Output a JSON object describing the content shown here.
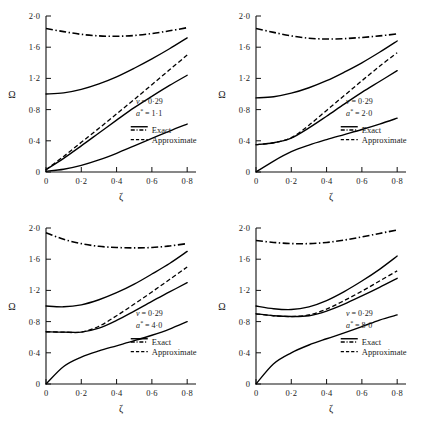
{
  "figure": {
    "type": "multi-panel-line-chart",
    "panel_count": 4,
    "layout": "2x2"
  },
  "axes": {
    "xlabel": "ζ",
    "ylabel": "Ω",
    "xticks": [
      "0",
      "0·2",
      "0·4",
      "0·6",
      "0·8"
    ],
    "xtick_values": [
      0,
      0.2,
      0.4,
      0.6,
      0.8
    ],
    "yticks": [
      "0",
      "0·4",
      "0·8",
      "1·2",
      "1·6",
      "2·0"
    ],
    "ytick_values": [
      0,
      0.4,
      0.8,
      1.2,
      1.6,
      2.0
    ],
    "xlim": [
      0,
      0.85
    ],
    "ylim": [
      0,
      2.0
    ],
    "grid": false
  },
  "legend": {
    "exact_label": "Exact",
    "approximate_label": "Approximate",
    "position": "inside-lower-right"
  },
  "chart_data": [
    {
      "type": "line",
      "panel": 1,
      "position": "top-left",
      "title": "",
      "xlabel": "ζ",
      "ylabel": "Ω",
      "xlim": [
        0,
        0.85
      ],
      "ylim": [
        0,
        2.0
      ],
      "grid": false,
      "annotations": [
        {
          "text": "v = 0·29",
          "symbol": "v",
          "value": "0·29"
        },
        {
          "text": "a* = 1·1",
          "symbol": "a*",
          "value": "1·1"
        }
      ],
      "x": [
        0,
        0.1,
        0.2,
        0.3,
        0.4,
        0.5,
        0.6,
        0.7,
        0.8
      ],
      "series": [
        {
          "name": "Exact mode 4",
          "style": "dash-dot",
          "values": [
            1.84,
            1.8,
            1.765,
            1.745,
            1.74,
            1.75,
            1.775,
            1.81,
            1.85
          ]
        },
        {
          "name": "Exact mode 3",
          "style": "solid",
          "values": [
            1.0,
            1.015,
            1.06,
            1.13,
            1.22,
            1.33,
            1.45,
            1.58,
            1.72
          ]
        },
        {
          "name": "Approximate mode 2",
          "style": "dashed",
          "values": [
            0.03,
            0.2,
            0.38,
            0.56,
            0.745,
            0.93,
            1.12,
            1.31,
            1.5
          ]
        },
        {
          "name": "Exact mode 2",
          "style": "solid",
          "values": [
            0.03,
            0.175,
            0.335,
            0.5,
            0.665,
            0.825,
            0.97,
            1.11,
            1.24
          ]
        },
        {
          "name": "Exact mode 1",
          "style": "solid",
          "values": [
            0.01,
            0.035,
            0.085,
            0.155,
            0.24,
            0.335,
            0.43,
            0.525,
            0.615
          ]
        }
      ]
    },
    {
      "type": "line",
      "panel": 2,
      "position": "top-right",
      "title": "",
      "xlabel": "ζ",
      "ylabel": "Ω",
      "xlim": [
        0,
        0.85
      ],
      "ylim": [
        0,
        2.0
      ],
      "grid": false,
      "annotations": [
        {
          "text": "v = 0·29",
          "symbol": "v",
          "value": "0·29"
        },
        {
          "text": "a* = 2·0",
          "symbol": "a*",
          "value": "2·0"
        }
      ],
      "x": [
        0,
        0.1,
        0.2,
        0.3,
        0.4,
        0.5,
        0.6,
        0.7,
        0.8
      ],
      "series": [
        {
          "name": "Exact mode 4",
          "style": "dash-dot",
          "values": [
            1.84,
            1.79,
            1.745,
            1.715,
            1.705,
            1.71,
            1.725,
            1.745,
            1.77
          ]
        },
        {
          "name": "Exact mode 3",
          "style": "solid",
          "values": [
            0.95,
            0.965,
            1.01,
            1.08,
            1.17,
            1.28,
            1.4,
            1.535,
            1.68
          ]
        },
        {
          "name": "Approximate mode 2",
          "style": "dashed",
          "values": [
            0.35,
            0.375,
            0.44,
            0.6,
            0.79,
            0.98,
            1.17,
            1.355,
            1.53
          ]
        },
        {
          "name": "Exact mode 2",
          "style": "solid",
          "values": [
            0.35,
            0.375,
            0.435,
            0.565,
            0.715,
            0.87,
            1.02,
            1.16,
            1.3
          ]
        },
        {
          "name": "Exact mode 1",
          "style": "solid",
          "values": [
            0.0,
            0.14,
            0.26,
            0.345,
            0.415,
            0.48,
            0.545,
            0.615,
            0.69
          ]
        }
      ]
    },
    {
      "type": "line",
      "panel": 3,
      "position": "bottom-left",
      "title": "",
      "xlabel": "ζ",
      "ylabel": "Ω",
      "xlim": [
        0,
        0.85
      ],
      "ylim": [
        0,
        2.0
      ],
      "grid": false,
      "annotations": [
        {
          "text": "v = 0·29",
          "symbol": "v",
          "value": "0·29"
        },
        {
          "text": "a* = 4·0",
          "symbol": "a*",
          "value": "4·0"
        }
      ],
      "x": [
        0,
        0.1,
        0.2,
        0.3,
        0.4,
        0.5,
        0.6,
        0.7,
        0.8
      ],
      "series": [
        {
          "name": "Exact mode 4",
          "style": "dash-dot",
          "values": [
            1.94,
            1.855,
            1.8,
            1.765,
            1.75,
            1.745,
            1.75,
            1.77,
            1.8
          ]
        },
        {
          "name": "Exact mode 3",
          "style": "solid",
          "values": [
            1.0,
            0.99,
            1.015,
            1.08,
            1.17,
            1.28,
            1.41,
            1.545,
            1.7
          ]
        },
        {
          "name": "Approximate mode 2",
          "style": "dashed",
          "values": [
            0.67,
            0.665,
            0.665,
            0.74,
            0.875,
            1.025,
            1.18,
            1.34,
            1.5
          ]
        },
        {
          "name": "Exact mode 2",
          "style": "solid",
          "values": [
            0.67,
            0.665,
            0.665,
            0.715,
            0.815,
            0.935,
            1.06,
            1.18,
            1.3
          ]
        },
        {
          "name": "Exact mode 1",
          "style": "solid",
          "values": [
            0.0,
            0.225,
            0.345,
            0.425,
            0.49,
            0.555,
            0.625,
            0.705,
            0.8
          ]
        }
      ]
    },
    {
      "type": "line",
      "panel": 4,
      "position": "bottom-right",
      "title": "",
      "xlabel": "ζ",
      "ylabel": "Ω",
      "xlim": [
        0,
        0.85
      ],
      "ylim": [
        0,
        2.0
      ],
      "grid": false,
      "annotations": [
        {
          "text": "v = 0·29",
          "symbol": "v",
          "value": "0·29"
        },
        {
          "text": "a* = 8·0",
          "symbol": "a*",
          "value": "8·0"
        }
      ],
      "x": [
        0,
        0.1,
        0.2,
        0.3,
        0.4,
        0.5,
        0.6,
        0.7,
        0.8
      ],
      "series": [
        {
          "name": "Exact mode 4",
          "style": "dash-dot",
          "values": [
            1.84,
            1.815,
            1.8,
            1.8,
            1.815,
            1.845,
            1.885,
            1.93,
            1.975
          ]
        },
        {
          "name": "Exact mode 3",
          "style": "solid",
          "values": [
            1.0,
            0.965,
            0.955,
            0.99,
            1.07,
            1.185,
            1.32,
            1.47,
            1.64
          ]
        },
        {
          "name": "Approximate mode 2",
          "style": "dashed",
          "values": [
            0.9,
            0.875,
            0.865,
            0.885,
            0.96,
            1.07,
            1.19,
            1.32,
            1.45
          ]
        },
        {
          "name": "Exact mode 2",
          "style": "solid",
          "values": [
            0.9,
            0.875,
            0.865,
            0.875,
            0.935,
            1.025,
            1.13,
            1.24,
            1.355
          ]
        },
        {
          "name": "Exact mode 1",
          "style": "solid",
          "values": [
            0.0,
            0.26,
            0.4,
            0.5,
            0.58,
            0.655,
            0.735,
            0.82,
            0.885
          ]
        }
      ]
    }
  ]
}
